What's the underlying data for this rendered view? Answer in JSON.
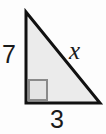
{
  "figure": {
    "type": "right-triangle-diagram",
    "background_color": "#fdfdfd",
    "shape": {
      "name": "right-triangle",
      "fill_color": "#ebebeb",
      "stroke_color": "#111111",
      "stroke_width": 3,
      "vertices": {
        "apex": [
          26,
          12
        ],
        "right_angle": [
          26,
          103
        ],
        "right": [
          100,
          103
        ]
      }
    },
    "right_angle_marker": {
      "name": "right-angle-square",
      "stroke_color": "#8a8a8a",
      "stroke_width": 2,
      "fill_color": "#e4e4e4",
      "x": 28,
      "y": 79,
      "width": 20,
      "height": 22
    },
    "labels": {
      "leg_vertical": "7",
      "leg_horizontal": "3",
      "hypotenuse": "x"
    }
  },
  "chart_data": {
    "type": "diagram",
    "title": "",
    "shape": "right triangle",
    "sides": [
      {
        "name": "vertical leg",
        "label": "7",
        "value": 7,
        "position": "left"
      },
      {
        "name": "horizontal leg",
        "label": "3",
        "value": 3,
        "position": "bottom"
      },
      {
        "name": "hypotenuse",
        "label": "x",
        "value": null,
        "position": "right-diagonal"
      }
    ],
    "annotations": [
      "right angle marker at bottom-left vertex"
    ]
  }
}
